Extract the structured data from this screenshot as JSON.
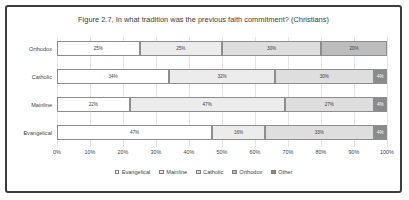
{
  "chart_data": {
    "type": "bar",
    "subtype": "stacked-horizontal-100pct",
    "title": "Figure 2.7, In what tradition was the previous faith commitment? (Christians)",
    "xlabel": "",
    "ylabel": "",
    "xlim": [
      0,
      100
    ],
    "grid": true,
    "legend_position": "bottom",
    "categories": [
      "Orthodox",
      "Catholic",
      "Mainline",
      "Evangelical"
    ],
    "xticks": [
      "0%",
      "10%",
      "20%",
      "30%",
      "40%",
      "50%",
      "60%",
      "70%",
      "80%",
      "90%",
      "100%"
    ],
    "xtick_values": [
      0,
      10,
      20,
      30,
      40,
      50,
      60,
      70,
      80,
      90,
      100
    ],
    "series": [
      {
        "name": "Evangelical",
        "values": [
          25,
          34,
          22,
          47
        ]
      },
      {
        "name": "Mainline",
        "values": [
          25,
          32,
          47,
          16
        ]
      },
      {
        "name": "Catholic",
        "values": [
          30,
          30,
          27,
          33
        ]
      },
      {
        "name": "Orthodox",
        "values": [
          20,
          0,
          0,
          0
        ]
      },
      {
        "name": "Other",
        "values": [
          0,
          4,
          4,
          4
        ]
      }
    ],
    "rows": [
      {
        "category": "Orthodox",
        "segments": [
          {
            "series": "Evangelical",
            "value": 25,
            "label": "25%"
          },
          {
            "series": "Mainline",
            "value": 25,
            "label": "25%"
          },
          {
            "series": "Catholic",
            "value": 30,
            "label": "30%"
          },
          {
            "series": "Orthodox",
            "value": 20,
            "label": "20%"
          },
          {
            "series": "Other",
            "value": 0,
            "label": ""
          }
        ]
      },
      {
        "category": "Catholic",
        "segments": [
          {
            "series": "Evangelical",
            "value": 34,
            "label": "34%"
          },
          {
            "series": "Mainline",
            "value": 32,
            "label": "32%"
          },
          {
            "series": "Catholic",
            "value": 30,
            "label": "30%"
          },
          {
            "series": "Orthodox",
            "value": 0,
            "label": ""
          },
          {
            "series": "Other",
            "value": 4,
            "label": "4%"
          }
        ]
      },
      {
        "category": "Mainline",
        "segments": [
          {
            "series": "Evangelical",
            "value": 22,
            "label": "22%"
          },
          {
            "series": "Mainline",
            "value": 47,
            "label": "47%"
          },
          {
            "series": "Catholic",
            "value": 27,
            "label": "27%"
          },
          {
            "series": "Orthodox",
            "value": 0,
            "label": ""
          },
          {
            "series": "Other",
            "value": 4,
            "label": "4%"
          }
        ]
      },
      {
        "category": "Evangelical",
        "segments": [
          {
            "series": "Evangelical",
            "value": 47,
            "label": "47%"
          },
          {
            "series": "Mainline",
            "value": 16,
            "label": "16%"
          },
          {
            "series": "Catholic",
            "value": 33,
            "label": "33%"
          },
          {
            "series": "Orthodox",
            "value": 0,
            "label": ""
          },
          {
            "series": "Other",
            "value": 4,
            "label": "4%"
          }
        ]
      }
    ],
    "legend": [
      {
        "label": "Evangelical",
        "color": "#ffffff"
      },
      {
        "label": "Mainline",
        "color": "#ececec"
      },
      {
        "label": "Catholic",
        "color": "#dedede"
      },
      {
        "label": "Orthodox",
        "color": "#bdbdbd"
      },
      {
        "label": "Other",
        "color": "#8a8a8a"
      }
    ]
  }
}
